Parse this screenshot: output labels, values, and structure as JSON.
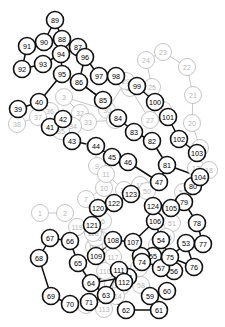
{
  "diagram": {
    "width": 225,
    "height": 327,
    "background_color": "#ffffff",
    "layers": [
      {
        "name": "dim-layer",
        "stroke_color": "#bdbdbd",
        "label_color": "#b5b5b5",
        "description": "faded background nodes"
      },
      {
        "name": "main-layer",
        "stroke_color": "#111111",
        "label_color": "#000000",
        "description": "bold foreground nodes"
      }
    ],
    "node_radius": 8.5,
    "node_count": 124
  },
  "chart_data": {
    "type": "scatter",
    "xlabel": "",
    "ylabel": "",
    "xlim": [
      0,
      225
    ],
    "ylim": [
      0,
      327
    ],
    "grid": false,
    "legend": "none",
    "nodes_dim": [
      {
        "id": "1",
        "x": 40,
        "y": 213
      },
      {
        "id": "2",
        "x": 65,
        "y": 213
      },
      {
        "id": "3",
        "x": 64,
        "y": 97
      },
      {
        "id": "4",
        "x": 86,
        "y": 305
      },
      {
        "id": "5",
        "x": 101,
        "y": 240
      },
      {
        "id": "6",
        "x": 103,
        "y": 221
      },
      {
        "id": "7",
        "x": 86,
        "y": 199
      },
      {
        "id": "8",
        "x": 95,
        "y": 146
      },
      {
        "id": "9",
        "x": 97,
        "y": 166
      },
      {
        "id": "10",
        "x": 104,
        "y": 188
      },
      {
        "id": "11",
        "x": 106,
        "y": 174
      },
      {
        "id": "12",
        "x": 124,
        "y": 190
      },
      {
        "id": "13",
        "x": 140,
        "y": 185
      },
      {
        "id": "14",
        "x": 121,
        "y": 287
      },
      {
        "id": "15",
        "x": 139,
        "y": 268
      },
      {
        "id": "16",
        "x": 157,
        "y": 245
      },
      {
        "id": "17",
        "x": 196,
        "y": 168
      },
      {
        "id": "18",
        "x": 209,
        "y": 170
      },
      {
        "id": "19",
        "x": 200,
        "y": 148
      },
      {
        "id": "20",
        "x": 192,
        "y": 123
      },
      {
        "id": "21",
        "x": 193,
        "y": 95
      },
      {
        "id": "22",
        "x": 187,
        "y": 67
      },
      {
        "id": "23",
        "x": 163,
        "y": 52
      },
      {
        "id": "24",
        "x": 146,
        "y": 60
      },
      {
        "id": "25",
        "x": 152,
        "y": 87
      },
      {
        "id": "26",
        "x": 163,
        "y": 110
      },
      {
        "id": "27",
        "x": 150,
        "y": 120
      },
      {
        "id": "28",
        "x": 130,
        "y": 88
      },
      {
        "id": "29",
        "x": 126,
        "y": 81
      },
      {
        "id": "30",
        "x": 107,
        "y": 110
      },
      {
        "id": "31",
        "x": 115,
        "y": 120
      },
      {
        "id": "32",
        "x": 80,
        "y": 113
      },
      {
        "id": "33",
        "x": 88,
        "y": 122
      },
      {
        "id": "34",
        "x": 73,
        "y": 126
      },
      {
        "id": "35",
        "x": 61,
        "y": 131
      },
      {
        "id": "36",
        "x": 50,
        "y": 111
      },
      {
        "id": "37",
        "x": 38,
        "y": 117
      },
      {
        "id": "38",
        "x": 17,
        "y": 124
      },
      {
        "id": "50",
        "x": 147,
        "y": 191
      },
      {
        "id": "51",
        "x": 172,
        "y": 223
      },
      {
        "id": "52",
        "x": 183,
        "y": 192
      },
      {
        "id": "58",
        "x": 141,
        "y": 285
      },
      {
        "id": "110",
        "x": 105,
        "y": 271
      },
      {
        "id": "113",
        "x": 104,
        "y": 309
      },
      {
        "id": "114",
        "x": 116,
        "y": 296
      },
      {
        "id": "115",
        "x": 94,
        "y": 247
      },
      {
        "id": "116",
        "x": 96,
        "y": 238
      },
      {
        "id": "117",
        "x": 113,
        "y": 257
      },
      {
        "id": "118",
        "x": 93,
        "y": 233
      },
      {
        "id": "119",
        "x": 77,
        "y": 227
      },
      {
        "id": "125",
        "x": 166,
        "y": 237
      }
    ],
    "nodes_main": [
      {
        "id": "39",
        "x": 18,
        "y": 109
      },
      {
        "id": "40",
        "x": 39,
        "y": 102
      },
      {
        "id": "41",
        "x": 50,
        "y": 127
      },
      {
        "id": "42",
        "x": 63,
        "y": 119
      },
      {
        "id": "43",
        "x": 72,
        "y": 141
      },
      {
        "id": "44",
        "x": 96,
        "y": 146
      },
      {
        "id": "45",
        "x": 112,
        "y": 157
      },
      {
        "id": "46",
        "x": 128,
        "y": 162
      },
      {
        "id": "47",
        "x": 159,
        "y": 182
      },
      {
        "id": "53",
        "x": 186,
        "y": 243
      },
      {
        "id": "54",
        "x": 161,
        "y": 240
      },
      {
        "id": "55",
        "x": 153,
        "y": 256
      },
      {
        "id": "56",
        "x": 174,
        "y": 271
      },
      {
        "id": "57",
        "x": 161,
        "y": 268
      },
      {
        "id": "59",
        "x": 150,
        "y": 296
      },
      {
        "id": "60",
        "x": 167,
        "y": 291
      },
      {
        "id": "61",
        "x": 159,
        "y": 310
      },
      {
        "id": "62",
        "x": 126,
        "y": 310
      },
      {
        "id": "63",
        "x": 106,
        "y": 295
      },
      {
        "id": "64",
        "x": 91,
        "y": 283
      },
      {
        "id": "65",
        "x": 78,
        "y": 263
      },
      {
        "id": "66",
        "x": 70,
        "y": 241
      },
      {
        "id": "67",
        "x": 50,
        "y": 238
      },
      {
        "id": "68",
        "x": 39,
        "y": 258
      },
      {
        "id": "69",
        "x": 51,
        "y": 296
      },
      {
        "id": "70",
        "x": 70,
        "y": 304
      },
      {
        "id": "71",
        "x": 89,
        "y": 302
      },
      {
        "id": "72",
        "x": 141,
        "y": 256
      },
      {
        "id": "73",
        "x": 128,
        "y": 277
      },
      {
        "id": "74",
        "x": 142,
        "y": 262
      },
      {
        "id": "75",
        "x": 170,
        "y": 257
      },
      {
        "id": "76",
        "x": 194,
        "y": 267
      },
      {
        "id": "77",
        "x": 203,
        "y": 244
      },
      {
        "id": "78",
        "x": 197,
        "y": 223
      },
      {
        "id": "79",
        "x": 184,
        "y": 202
      },
      {
        "id": "80",
        "x": 193,
        "y": 186
      },
      {
        "id": "81",
        "x": 167,
        "y": 165
      },
      {
        "id": "82",
        "x": 152,
        "y": 141
      },
      {
        "id": "83",
        "x": 134,
        "y": 132
      },
      {
        "id": "84",
        "x": 118,
        "y": 118
      },
      {
        "id": "85",
        "x": 103,
        "y": 100
      },
      {
        "id": "86",
        "x": 79,
        "y": 82
      },
      {
        "id": "87",
        "x": 78,
        "y": 47
      },
      {
        "id": "88",
        "x": 62,
        "y": 39
      },
      {
        "id": "89",
        "x": 55,
        "y": 20
      },
      {
        "id": "90",
        "x": 44,
        "y": 42
      },
      {
        "id": "91",
        "x": 27,
        "y": 46
      },
      {
        "id": "92",
        "x": 22,
        "y": 69
      },
      {
        "id": "93",
        "x": 43,
        "y": 64
      },
      {
        "id": "94",
        "x": 61,
        "y": 54
      },
      {
        "id": "95",
        "x": 62,
        "y": 74
      },
      {
        "id": "96",
        "x": 85,
        "y": 57
      },
      {
        "id": "97",
        "x": 99,
        "y": 76
      },
      {
        "id": "98",
        "x": 116,
        "y": 76
      },
      {
        "id": "99",
        "x": 137,
        "y": 86
      },
      {
        "id": "100",
        "x": 155,
        "y": 102
      },
      {
        "id": "101",
        "x": 168,
        "y": 117
      },
      {
        "id": "102",
        "x": 179,
        "y": 139
      },
      {
        "id": "103",
        "x": 197,
        "y": 153
      },
      {
        "id": "104",
        "x": 200,
        "y": 177
      },
      {
        "id": "105",
        "x": 171,
        "y": 208
      },
      {
        "id": "106",
        "x": 155,
        "y": 221
      },
      {
        "id": "107",
        "x": 133,
        "y": 242
      },
      {
        "id": "108",
        "x": 113,
        "y": 240
      },
      {
        "id": "109",
        "x": 96,
        "y": 256
      },
      {
        "id": "111",
        "x": 119,
        "y": 270
      },
      {
        "id": "112",
        "x": 124,
        "y": 282
      },
      {
        "id": "120",
        "x": 98,
        "y": 208
      },
      {
        "id": "121",
        "x": 92,
        "y": 225
      },
      {
        "id": "122",
        "x": 114,
        "y": 203
      },
      {
        "id": "123",
        "x": 131,
        "y": 194
      },
      {
        "id": "124",
        "x": 153,
        "y": 206
      }
    ],
    "edges_dim": [
      [
        "38",
        "37"
      ],
      [
        "37",
        "36"
      ],
      [
        "37",
        "35"
      ],
      [
        "36",
        "34"
      ],
      [
        "35",
        "34"
      ],
      [
        "34",
        "33"
      ],
      [
        "33",
        "32"
      ],
      [
        "33",
        "31"
      ],
      [
        "31",
        "30"
      ],
      [
        "30",
        "29"
      ],
      [
        "29",
        "28"
      ],
      [
        "28",
        "27"
      ],
      [
        "27",
        "26"
      ],
      [
        "26",
        "25"
      ],
      [
        "25",
        "24"
      ],
      [
        "24",
        "23"
      ],
      [
        "23",
        "22"
      ],
      [
        "22",
        "21"
      ],
      [
        "21",
        "20"
      ],
      [
        "20",
        "19"
      ],
      [
        "19",
        "17"
      ],
      [
        "17",
        "18"
      ],
      [
        "17",
        "52"
      ],
      [
        "52",
        "51"
      ],
      [
        "51",
        "125"
      ],
      [
        "51",
        "16"
      ],
      [
        "16",
        "15"
      ],
      [
        "15",
        "14"
      ],
      [
        "14",
        "113"
      ],
      [
        "113",
        "110"
      ],
      [
        "110",
        "117"
      ],
      [
        "117",
        "116"
      ],
      [
        "116",
        "115"
      ],
      [
        "115",
        "118"
      ],
      [
        "118",
        "119"
      ],
      [
        "119",
        "2"
      ],
      [
        "2",
        "1"
      ],
      [
        "50",
        "13"
      ],
      [
        "13",
        "12"
      ],
      [
        "12",
        "11"
      ],
      [
        "11",
        "10"
      ],
      [
        "10",
        "9"
      ],
      [
        "9",
        "8"
      ],
      [
        "10",
        "7"
      ],
      [
        "7",
        "6"
      ],
      [
        "6",
        "5"
      ],
      [
        "5",
        "116"
      ],
      [
        "13",
        "50"
      ],
      [
        "14",
        "4"
      ],
      [
        "32",
        "3"
      ],
      [
        "3",
        "30"
      ],
      [
        "58",
        "15"
      ],
      [
        "125",
        "52"
      ]
    ],
    "edges_main": [
      [
        "39",
        "40"
      ],
      [
        "40",
        "41"
      ],
      [
        "41",
        "42"
      ],
      [
        "42",
        "43"
      ],
      [
        "43",
        "44"
      ],
      [
        "44",
        "45"
      ],
      [
        "45",
        "46"
      ],
      [
        "46",
        "47"
      ],
      [
        "47",
        "81"
      ],
      [
        "81",
        "82"
      ],
      [
        "82",
        "83"
      ],
      [
        "83",
        "84"
      ],
      [
        "84",
        "85"
      ],
      [
        "85",
        "86"
      ],
      [
        "86",
        "96"
      ],
      [
        "96",
        "87"
      ],
      [
        "87",
        "88"
      ],
      [
        "88",
        "89"
      ],
      [
        "89",
        "90"
      ],
      [
        "90",
        "91"
      ],
      [
        "91",
        "92"
      ],
      [
        "92",
        "93"
      ],
      [
        "93",
        "94"
      ],
      [
        "94",
        "95"
      ],
      [
        "94",
        "88"
      ],
      [
        "94",
        "87"
      ],
      [
        "95",
        "40"
      ],
      [
        "96",
        "97"
      ],
      [
        "97",
        "98"
      ],
      [
        "98",
        "99"
      ],
      [
        "99",
        "100"
      ],
      [
        "100",
        "101"
      ],
      [
        "101",
        "102"
      ],
      [
        "102",
        "103"
      ],
      [
        "103",
        "104"
      ],
      [
        "104",
        "79"
      ],
      [
        "79",
        "80"
      ],
      [
        "79",
        "105"
      ],
      [
        "105",
        "124"
      ],
      [
        "124",
        "106"
      ],
      [
        "106",
        "107"
      ],
      [
        "107",
        "108"
      ],
      [
        "108",
        "109"
      ],
      [
        "109",
        "121"
      ],
      [
        "121",
        "120"
      ],
      [
        "120",
        "122"
      ],
      [
        "122",
        "123"
      ],
      [
        "123",
        "47"
      ],
      [
        "121",
        "119"
      ],
      [
        "121",
        "66"
      ],
      [
        "66",
        "67"
      ],
      [
        "67",
        "68"
      ],
      [
        "68",
        "69"
      ],
      [
        "69",
        "70"
      ],
      [
        "70",
        "71"
      ],
      [
        "66",
        "65"
      ],
      [
        "65",
        "64"
      ],
      [
        "64",
        "63"
      ],
      [
        "63",
        "62"
      ],
      [
        "62",
        "61"
      ],
      [
        "61",
        "59"
      ],
      [
        "59",
        "60"
      ],
      [
        "59",
        "58"
      ],
      [
        "64",
        "73"
      ],
      [
        "73",
        "74"
      ],
      [
        "74",
        "75"
      ],
      [
        "75",
        "57"
      ],
      [
        "57",
        "56"
      ],
      [
        "75",
        "53"
      ],
      [
        "53",
        "77"
      ],
      [
        "77",
        "78"
      ],
      [
        "78",
        "79"
      ],
      [
        "53",
        "76"
      ],
      [
        "75",
        "76"
      ],
      [
        "54",
        "75"
      ],
      [
        "106",
        "54"
      ],
      [
        "81",
        "104"
      ],
      [
        "63",
        "111"
      ],
      [
        "111",
        "112"
      ],
      [
        "112",
        "73"
      ],
      [
        "64",
        "111"
      ],
      [
        "85",
        "84"
      ],
      [
        "99",
        "25"
      ],
      [
        "73",
        "55"
      ],
      [
        "55",
        "72"
      ],
      [
        "86",
        "85"
      ],
      [
        "122",
        "121"
      ]
    ]
  }
}
